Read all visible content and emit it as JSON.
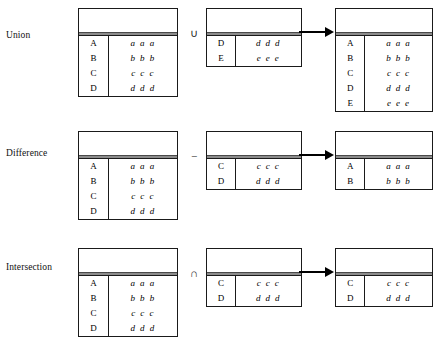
{
  "rows": [
    {
      "label": "Union",
      "operator_symbol": "∪",
      "operator_name": "union-operator",
      "arrow_name": "result-arrow",
      "left": {
        "name": "left-operand-table",
        "rows": [
          {
            "key": "A",
            "value": "a a a"
          },
          {
            "key": "B",
            "value": "b b b"
          },
          {
            "key": "C",
            "value": "c c c"
          },
          {
            "key": "D",
            "value": "d d d"
          }
        ]
      },
      "mid": {
        "name": "right-operand-table",
        "rows": [
          {
            "key": "D",
            "value": "d d d"
          },
          {
            "key": "E",
            "value": "e e e"
          }
        ]
      },
      "result": {
        "name": "result-table",
        "rows": [
          {
            "key": "A",
            "value": "a a a"
          },
          {
            "key": "B",
            "value": "b b b"
          },
          {
            "key": "C",
            "value": "c c c"
          },
          {
            "key": "D",
            "value": "d d d"
          },
          {
            "key": "E",
            "value": "e e e"
          }
        ]
      }
    },
    {
      "label": "Difference",
      "operator_symbol": "−",
      "operator_name": "minus-operator",
      "arrow_name": "result-arrow",
      "left": {
        "name": "left-operand-table",
        "rows": [
          {
            "key": "A",
            "value": "a a a"
          },
          {
            "key": "B",
            "value": "b b b"
          },
          {
            "key": "C",
            "value": "c c c"
          },
          {
            "key": "D",
            "value": "d d d"
          }
        ]
      },
      "mid": {
        "name": "right-operand-table",
        "rows": [
          {
            "key": "C",
            "value": "c c c"
          },
          {
            "key": "D",
            "value": "d d d"
          }
        ]
      },
      "result": {
        "name": "result-table",
        "rows": [
          {
            "key": "A",
            "value": "a a a"
          },
          {
            "key": "B",
            "value": "b b b"
          }
        ]
      }
    },
    {
      "label": "Intersection",
      "operator_symbol": "∩",
      "operator_name": "intersection-operator",
      "arrow_name": "result-arrow",
      "left": {
        "name": "left-operand-table",
        "rows": [
          {
            "key": "A",
            "value": "a a a"
          },
          {
            "key": "B",
            "value": "b b b"
          },
          {
            "key": "C",
            "value": "c c c"
          },
          {
            "key": "D",
            "value": "d d d"
          }
        ]
      },
      "mid": {
        "name": "right-operand-table",
        "rows": [
          {
            "key": "C",
            "value": "c c c"
          },
          {
            "key": "D",
            "value": "d d d"
          }
        ]
      },
      "result": {
        "name": "result-table",
        "rows": [
          {
            "key": "C",
            "value": "c c c"
          },
          {
            "key": "D",
            "value": "d d d"
          }
        ]
      }
    }
  ],
  "colors": {
    "border": "#1a1a1a",
    "header_rule": "#8c8c8c",
    "text": "#000000",
    "background": "#ffffff"
  }
}
